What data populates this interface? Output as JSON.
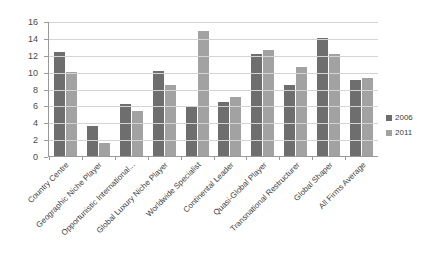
{
  "chart_data": {
    "type": "bar",
    "title": "",
    "subtitle": "",
    "xlabel": "",
    "ylabel": "",
    "ylim": [
      0,
      16
    ],
    "ytick_step": 2,
    "yticks": [
      16,
      14,
      12,
      10,
      8,
      6,
      4,
      2,
      0
    ],
    "grid": true,
    "legend_position": "right",
    "categories": [
      "Country Centre",
      "Geographic Niche Player",
      "Opportunistic International...",
      "Global Luxury Niche Player",
      "Worldwide Specialist",
      "Continental Leader",
      "Quasi-Global Player",
      "Transnational Restructurer",
      "Global Shaper",
      "All Firms Average"
    ],
    "series": [
      {
        "name": "2006",
        "color": "#6e6e6e",
        "values": [
          12.3,
          3.6,
          6.2,
          10.1,
          5.8,
          6.4,
          12.1,
          8.4,
          14.0,
          9.0
        ]
      },
      {
        "name": "2011",
        "color": "#a2a2a2",
        "values": [
          9.9,
          1.6,
          5.3,
          8.4,
          14.8,
          7.0,
          12.6,
          10.5,
          12.1,
          9.3
        ]
      }
    ]
  },
  "legend": {
    "items": [
      {
        "label": "2006"
      },
      {
        "label": "2011"
      }
    ]
  },
  "colors": {
    "series_2006": "#6e6e6e",
    "series_2011": "#a2a2a2",
    "gridline": "#d4d4d4",
    "axis": "#9a9a9a",
    "text": "#3d3d3d",
    "background": "#ffffff"
  }
}
